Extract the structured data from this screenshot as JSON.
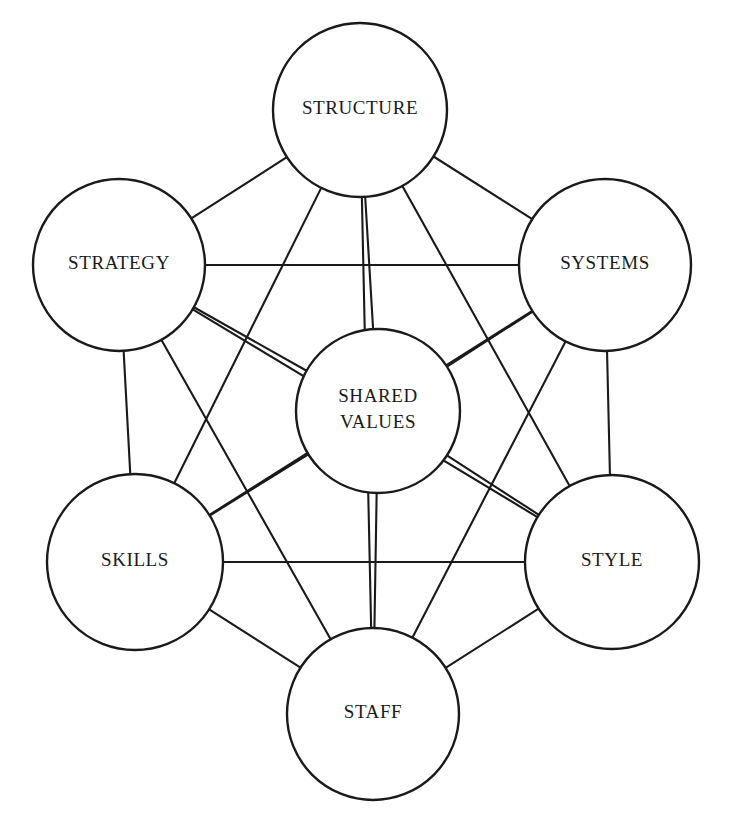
{
  "diagram": {
    "type": "network-diagram",
    "background_color": "#ffffff",
    "line_color": "#1a1a1a",
    "circle_fill": "#ffffff",
    "canvas": {
      "width": 734,
      "height": 828
    },
    "nodes": [
      {
        "id": "structure",
        "label": "STRUCTURE",
        "lines": [
          "STRUCTURE"
        ],
        "cx": 360,
        "cy": 110,
        "r": 87
      },
      {
        "id": "strategy",
        "label": "STRATEGY",
        "lines": [
          "STRATEGY"
        ],
        "cx": 119,
        "cy": 265,
        "r": 86
      },
      {
        "id": "systems",
        "label": "SYSTEMS",
        "lines": [
          "SYSTEMS"
        ],
        "cx": 605,
        "cy": 265,
        "r": 86
      },
      {
        "id": "shared-values",
        "label": "SHARED VALUES",
        "lines": [
          "SHARED",
          "VALUES"
        ],
        "cx": 378,
        "cy": 411,
        "r": 82
      },
      {
        "id": "skills",
        "label": "SKILLS",
        "lines": [
          "SKILLS"
        ],
        "cx": 135,
        "cy": 562,
        "r": 88
      },
      {
        "id": "style",
        "label": "STYLE",
        "lines": [
          "STYLE"
        ],
        "cx": 612,
        "cy": 562,
        "r": 87
      },
      {
        "id": "staff",
        "label": "STAFF",
        "lines": [
          "STAFF"
        ],
        "cx": 373,
        "cy": 714,
        "r": 86
      }
    ],
    "links": [
      {
        "from": "structure",
        "to": "strategy"
      },
      {
        "from": "structure",
        "to": "systems"
      },
      {
        "from": "structure",
        "to": "shared-values"
      },
      {
        "from": "structure",
        "to": "skills"
      },
      {
        "from": "structure",
        "to": "style"
      },
      {
        "from": "structure",
        "to": "staff"
      },
      {
        "from": "strategy",
        "to": "systems"
      },
      {
        "from": "strategy",
        "to": "shared-values"
      },
      {
        "from": "strategy",
        "to": "skills"
      },
      {
        "from": "strategy",
        "to": "style"
      },
      {
        "from": "strategy",
        "to": "staff"
      },
      {
        "from": "systems",
        "to": "shared-values"
      },
      {
        "from": "systems",
        "to": "skills"
      },
      {
        "from": "systems",
        "to": "style"
      },
      {
        "from": "systems",
        "to": "staff"
      },
      {
        "from": "shared-values",
        "to": "skills"
      },
      {
        "from": "shared-values",
        "to": "style"
      },
      {
        "from": "shared-values",
        "to": "staff"
      },
      {
        "from": "skills",
        "to": "style"
      },
      {
        "from": "skills",
        "to": "staff"
      },
      {
        "from": "style",
        "to": "staff"
      }
    ]
  }
}
